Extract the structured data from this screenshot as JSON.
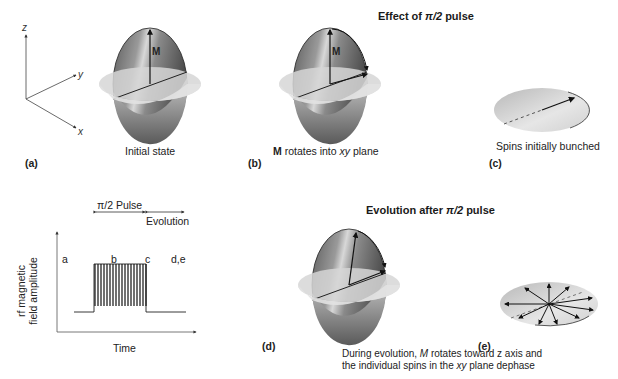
{
  "top_section": {
    "title_prefix": "Effect of ",
    "title_pi": "π/2",
    "title_suffix": " pulse",
    "panels": [
      {
        "tag": "(a)",
        "caption": "Initial state",
        "vector_label": "M"
      },
      {
        "tag": "(b)",
        "caption_bold": "M",
        "caption_mid": " rotates into ",
        "caption_it": "xy",
        "caption_end": " plane",
        "vector_label": "M"
      },
      {
        "tag": "(c)",
        "caption": "Spins initially bunched"
      }
    ],
    "axes": {
      "z": "z",
      "y": "y",
      "x": "x"
    }
  },
  "bottom_section": {
    "title_prefix": "Evolution after ",
    "title_pi": "π/2",
    "title_suffix": " pulse",
    "panels": [
      {
        "tag": "(d)"
      },
      {
        "tag": "(e)"
      }
    ],
    "caption_line1_a": "During evolution, ",
    "caption_line1_m": "M",
    "caption_line1_b": " rotates toward z axis and",
    "caption_line2_a": "the individual spins in the ",
    "caption_line2_it": "xy",
    "caption_line2_b": " plane dephase"
  },
  "pulse_plot": {
    "pulse_label": "π/2 Pulse",
    "evolution_label": "Evolution",
    "ylabel_line1": "rf magnetic",
    "ylabel_line2": "field amplitude",
    "xlabel": "Time",
    "markers": [
      "a",
      "b",
      "c",
      "d,e"
    ]
  }
}
